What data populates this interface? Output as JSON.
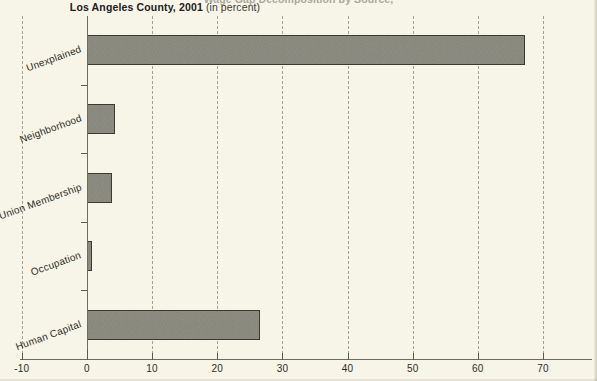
{
  "title": {
    "clipped_line": "Wage Gap Decomposition by Source,",
    "main_strong": "Los Angeles County, 2001",
    "main_light": "(in percent)"
  },
  "colors": {
    "background": "#f7f5e8",
    "bar_fill": "#8b8a7f",
    "bar_border": "#3a3a33",
    "axis": "#6d6b5d",
    "gridline": "#9a9888",
    "text": "#2c2c26"
  },
  "chart_data": {
    "type": "bar",
    "orientation": "horizontal",
    "title": "Los Angeles County, 2001 (in percent)",
    "xlabel": "",
    "ylabel": "",
    "categories": [
      "Unexplained",
      "Neighborhood",
      "Union Membership",
      "Occupation",
      "Human Capital"
    ],
    "values": [
      67.2,
      4.3,
      3.8,
      0.8,
      26.6
    ],
    "xlim": [
      -10,
      75
    ],
    "xticks": [
      -10,
      0,
      10,
      20,
      30,
      40,
      50,
      60,
      70
    ],
    "xticklabels": [
      "-10",
      "0",
      "10",
      "20",
      "30",
      "40",
      "50",
      "60",
      "70"
    ],
    "grid": true,
    "grid_axis": "x",
    "grid_style": "dashed",
    "legend": false,
    "series": [
      {
        "name": "share of wage gap",
        "values": [
          67.2,
          4.3,
          3.8,
          0.8,
          26.6
        ]
      }
    ]
  },
  "axis_ticks": {
    "x": [
      {
        "value": -10,
        "label": "-10"
      },
      {
        "value": 0,
        "label": "0"
      },
      {
        "value": 10,
        "label": "10"
      },
      {
        "value": 20,
        "label": "20"
      },
      {
        "value": 30,
        "label": "30"
      },
      {
        "value": 40,
        "label": "40"
      },
      {
        "value": 50,
        "label": "50"
      },
      {
        "value": 60,
        "label": "60"
      },
      {
        "value": 70,
        "label": "70"
      }
    ]
  }
}
